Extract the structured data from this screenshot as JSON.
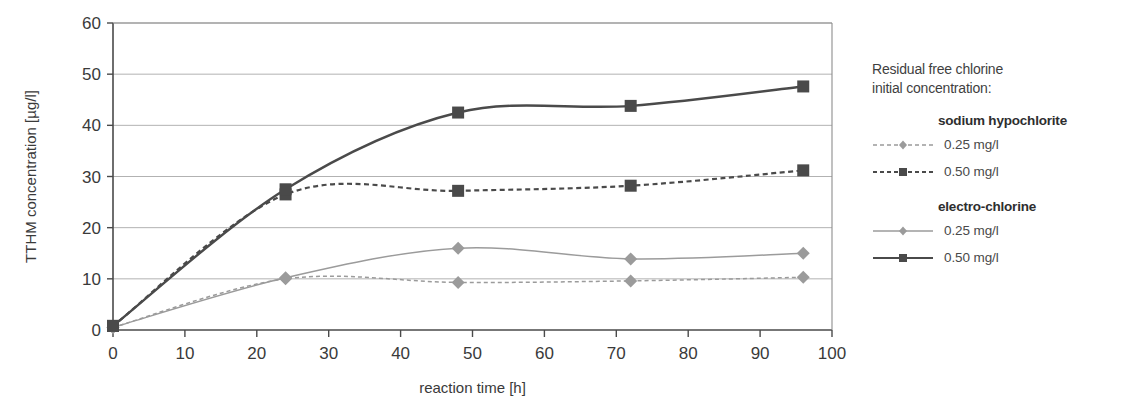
{
  "chart_data": {
    "type": "line",
    "title": "",
    "xlabel": "reaction time [h]",
    "ylabel": "TTHM concentration [µg/l]",
    "xlim": [
      0,
      100
    ],
    "ylim": [
      0,
      60
    ],
    "xticks": [
      0,
      10,
      20,
      30,
      40,
      50,
      60,
      70,
      80,
      90,
      100
    ],
    "yticks": [
      0,
      10,
      20,
      30,
      40,
      50,
      60
    ],
    "xticklabels": [
      "0",
      "10",
      "20",
      "30",
      "40",
      "50",
      "60",
      "70",
      "80",
      "90",
      "100"
    ],
    "yticklabels": [
      "0",
      "10",
      "20",
      "30",
      "40",
      "50",
      "60"
    ],
    "grid": "horizontal",
    "legend_position": "right-outside",
    "x": [
      0,
      24,
      48,
      72,
      96
    ],
    "series": [
      {
        "name": "sodium hypochlorite 0.25 mg/l",
        "group": "sodium hypochlorite",
        "level": "0.25 mg/l",
        "values": [
          0.5,
          10.0,
          9.3,
          9.6,
          10.3
        ],
        "color": "#9b9b9b",
        "dash": "dashed",
        "marker": "diamond"
      },
      {
        "name": "sodium hypochlorite 0.50 mg/l",
        "group": "sodium hypochlorite",
        "level": "0.50 mg/l",
        "values": [
          0.8,
          26.5,
          27.2,
          28.2,
          31.2
        ],
        "color": "#4a4a4a",
        "dash": "dashed",
        "marker": "square"
      },
      {
        "name": "electro-chlorine 0.25 mg/l",
        "group": "electro-chlorine",
        "level": "0.25 mg/l",
        "values": [
          0.5,
          10.2,
          16.0,
          13.9,
          15.0
        ],
        "color": "#9b9b9b",
        "dash": "solid",
        "marker": "diamond"
      },
      {
        "name": "electro-chlorine 0.50 mg/l",
        "group": "electro-chlorine",
        "level": "0.50 mg/l",
        "values": [
          0.8,
          27.5,
          42.5,
          43.8,
          47.6
        ],
        "color": "#4a4a4a",
        "dash": "solid",
        "marker": "square"
      }
    ]
  },
  "legend": {
    "title": "Residual free chlorine\ninitial concentration:",
    "groups": [
      {
        "head": "sodium hypochlorite",
        "rows": [
          {
            "label": "0.25 mg/l"
          },
          {
            "label": "0.50 mg/l"
          }
        ]
      },
      {
        "head": "electro-chlorine",
        "rows": [
          {
            "label": "0.25 mg/l"
          },
          {
            "label": "0.50 mg/l"
          }
        ]
      }
    ]
  },
  "axes": {
    "x_title": "reaction time [h]",
    "y_title": "TTHM concentration [µg/l]"
  }
}
